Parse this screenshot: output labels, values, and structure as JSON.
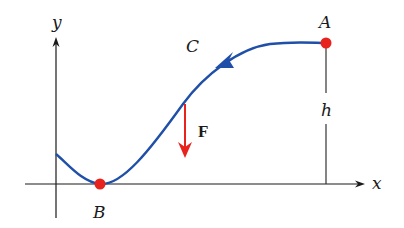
{
  "diagram": {
    "title": "",
    "axes": {
      "x_label": "x",
      "y_label": "y"
    },
    "curve": {
      "label": "C",
      "color": "#1f4fa8",
      "direction": "from A to B"
    },
    "points": [
      {
        "label": "A",
        "color": "#e8221c",
        "description": "start point at height h"
      },
      {
        "label": "B",
        "color": "#e8221c",
        "description": "lowest point on x-axis"
      }
    ],
    "height_marker": {
      "label": "h"
    },
    "force": {
      "label": "F",
      "color": "#e8221c",
      "direction": "downward"
    }
  }
}
